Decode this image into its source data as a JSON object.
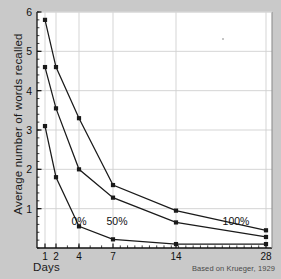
{
  "chart_data": {
    "type": "line",
    "title": "",
    "xlabel": "Days",
    "ylabel": "Average number of words recalled",
    "annotation": "Based on Krueger, 1929",
    "x": [
      1,
      2,
      4,
      7,
      14,
      28
    ],
    "categories": [
      "1",
      "2",
      "4",
      "7",
      "14",
      "28"
    ],
    "xtick_labels": [
      "1",
      "2",
      "4",
      "7",
      "14",
      "28"
    ],
    "ytick_labels": [
      "1",
      "2",
      "3",
      "4",
      "5",
      "6"
    ],
    "yticks": [
      1,
      2,
      3,
      4,
      5,
      6
    ],
    "ylim": [
      0,
      6
    ],
    "xscale": "ordinal-compressed",
    "grid": true,
    "legend_position": "inline-labels",
    "series": [
      {
        "name": "100%",
        "label": "100%",
        "values": [
          5.8,
          4.6,
          3.3,
          1.6,
          0.95,
          0.45
        ],
        "color": "#1a1a1a"
      },
      {
        "name": "50%",
        "label": "50%",
        "values": [
          4.6,
          3.55,
          2.0,
          1.28,
          0.65,
          0.28
        ],
        "color": "#1a1a1a"
      },
      {
        "name": "0%",
        "label": "0%",
        "values": [
          3.1,
          1.8,
          0.55,
          0.22,
          0.1,
          0.1
        ],
        "color": "#1a1a1a"
      }
    ]
  },
  "figure": {
    "background_color": "#c9c9c9",
    "plot_background_color": "#ffffff",
    "axis_color": "#111111",
    "grid_color": "#d0d0d0"
  }
}
